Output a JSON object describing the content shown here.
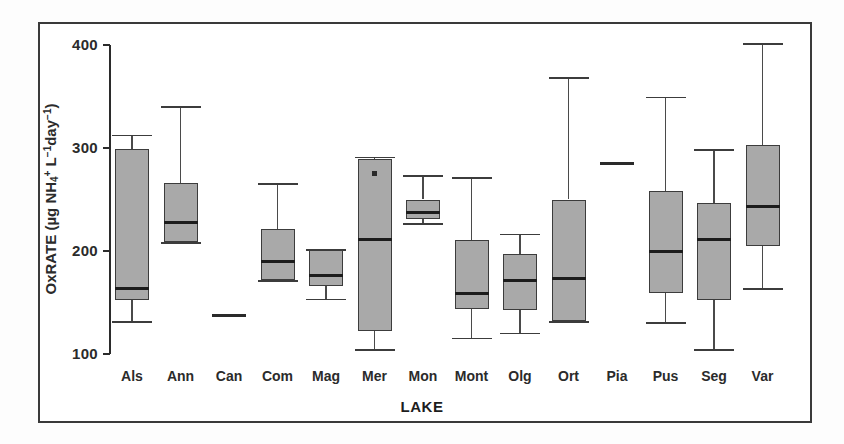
{
  "figure": {
    "xlabel": "LAKE",
    "ylabel_html": "OxRATE (µg NH4+ L-1 day-1)",
    "ylabel_main": "OxRATE (µg NH",
    "frame_color": "#3a3a3a",
    "box_fill": "#a9a9a9",
    "box_edge": "#3c3c3c",
    "median_color": "#1c1c1c"
  },
  "chart_data": {
    "type": "box",
    "title": "",
    "xlabel": "LAKE",
    "ylabel": "OxRATE (µg NH4+ L⁻¹ day⁻¹)",
    "ylim": [
      100,
      400
    ],
    "yticks": [
      100,
      200,
      300,
      400
    ],
    "ytick_labels": [
      "100",
      "200",
      "300",
      "400"
    ],
    "grid": false,
    "legend": null,
    "categories": [
      "Als",
      "Ann",
      "Can",
      "Com",
      "Mag",
      "Mer",
      "Mon",
      "Mont",
      "Olg",
      "Ort",
      "Pia",
      "Pus",
      "Seg",
      "Var"
    ],
    "boxes": [
      {
        "label": "Als",
        "whisker_low": 131,
        "q1": 152,
        "median": 164,
        "q3": 299,
        "whisker_high": 312,
        "outliers": []
      },
      {
        "label": "Ann",
        "whisker_low": 208,
        "q1": 209,
        "median": 228,
        "q3": 266,
        "whisker_high": 340,
        "outliers": []
      },
      {
        "label": "Can",
        "whisker_low": 138,
        "q1": 138,
        "median": 138,
        "q3": 138,
        "whisker_high": 138,
        "outliers": [],
        "single_value": true
      },
      {
        "label": "Com",
        "whisker_low": 171,
        "q1": 172,
        "median": 190,
        "q3": 221,
        "whisker_high": 265,
        "outliers": []
      },
      {
        "label": "Mag",
        "whisker_low": 153,
        "q1": 166,
        "median": 176,
        "q3": 201,
        "whisker_high": 201,
        "outliers": []
      },
      {
        "label": "Mer",
        "whisker_low": 104,
        "q1": 122,
        "median": 211,
        "q3": 289,
        "whisker_high": 291,
        "outliers": [
          275
        ]
      },
      {
        "label": "Mon",
        "whisker_low": 226,
        "q1": 231,
        "median": 237,
        "q3": 250,
        "whisker_high": 273,
        "outliers": []
      },
      {
        "label": "Mont",
        "whisker_low": 115,
        "q1": 144,
        "median": 159,
        "q3": 211,
        "whisker_high": 271,
        "outliers": []
      },
      {
        "label": "Olg",
        "whisker_low": 120,
        "q1": 143,
        "median": 171,
        "q3": 197,
        "whisker_high": 216,
        "outliers": []
      },
      {
        "label": "Ort",
        "whisker_low": 131,
        "q1": 132,
        "median": 173,
        "q3": 250,
        "whisker_high": 368,
        "outliers": []
      },
      {
        "label": "Pia",
        "whisker_low": 285,
        "q1": 285,
        "median": 285,
        "q3": 285,
        "whisker_high": 285,
        "outliers": [],
        "single_value": true
      },
      {
        "label": "Pus",
        "whisker_low": 130,
        "q1": 159,
        "median": 200,
        "q3": 258,
        "whisker_high": 349,
        "outliers": []
      },
      {
        "label": "Seg",
        "whisker_low": 104,
        "q1": 152,
        "median": 211,
        "q3": 247,
        "whisker_high": 298,
        "outliers": []
      },
      {
        "label": "Var",
        "whisker_low": 163,
        "q1": 205,
        "median": 243,
        "q3": 303,
        "whisker_high": 401,
        "outliers": []
      }
    ]
  }
}
